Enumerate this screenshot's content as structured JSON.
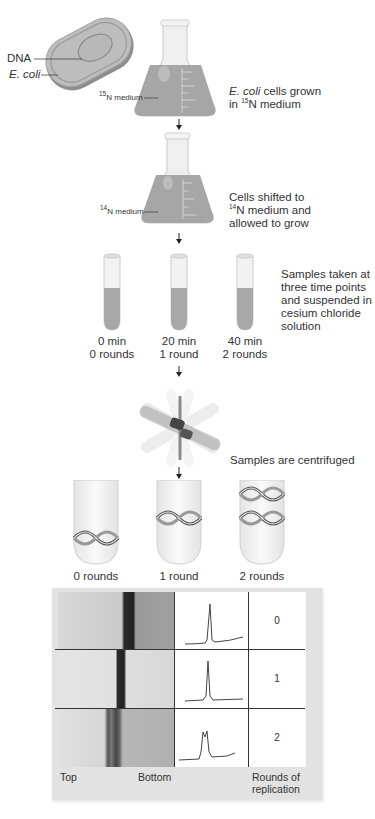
{
  "step1": {
    "dna_label": "DNA",
    "ecoli_label": "E. coli",
    "medium_label": "N medium",
    "medium_isotope": "15",
    "caption_italic": "E. coli",
    "caption_rest_line1": " cells grown",
    "caption_line2_prefix": "in ",
    "caption_line2_isotope": "15",
    "caption_line2_suffix": "N medium"
  },
  "step2": {
    "medium_label": "N medium",
    "medium_isotope": "14",
    "caption_line1": "Cells shifted to",
    "caption_line2_isotope": "14",
    "caption_line2_suffix": "N medium and",
    "caption_line3": "allowed to grow"
  },
  "step3": {
    "caption_lines": [
      "Samples taken at",
      "three time points",
      "and suspended in",
      "cesium chloride",
      "solution"
    ],
    "tubes": [
      {
        "time": "0 min",
        "rounds": "0 rounds"
      },
      {
        "time": "20 min",
        "rounds": "1 round"
      },
      {
        "time": "40 min",
        "rounds": "2 rounds"
      }
    ]
  },
  "step4": {
    "caption": "Samples are centrifuged"
  },
  "step5": {
    "tubes": [
      {
        "label": "0 rounds"
      },
      {
        "label": "1 round"
      },
      {
        "label": "2 rounds"
      }
    ]
  },
  "results": {
    "rows": [
      {
        "round": "0",
        "band": "heavy"
      },
      {
        "round": "1",
        "band": "intermediate"
      },
      {
        "round": "2",
        "band": "intermediate + light"
      }
    ],
    "top_label": "Top",
    "bottom_label": "Bottom",
    "rounds_label_line1": "Rounds of",
    "rounds_label_line2": "replication"
  },
  "colors": {
    "medium": "#a8a8a8",
    "glass": "#f2f2f2",
    "band": "#2a2a2a",
    "panel_bg": "#e2e2e2"
  }
}
